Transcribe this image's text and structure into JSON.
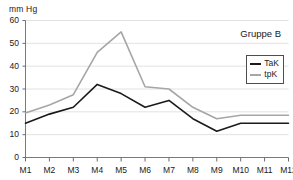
{
  "chart_data": {
    "type": "line",
    "title": "",
    "annotation": "Gruppe B",
    "xlabel": "",
    "ylabel": "mm Hg",
    "ylim": [
      0,
      60
    ],
    "yticks": [
      0,
      10,
      20,
      30,
      40,
      50,
      60
    ],
    "ytick_labels": [
      "0",
      "10",
      "20",
      "30",
      "40",
      "50",
      "60"
    ],
    "grid": true,
    "legend_position": "top-right",
    "categories": [
      "M1",
      "M2",
      "M3",
      "M4",
      "M5",
      "M6",
      "M7",
      "M8",
      "M9",
      "M10",
      "M11",
      "M12"
    ],
    "series": [
      {
        "name": "TaK",
        "color": "#1a1a1a",
        "values": [
          15,
          19,
          22,
          32,
          28,
          22,
          25,
          17,
          11.5,
          15,
          15,
          15
        ]
      },
      {
        "name": "tpK",
        "color": "#a6a6a6",
        "values": [
          19.5,
          23,
          27.5,
          46,
          55,
          31,
          30,
          22,
          17,
          18.5,
          18.5,
          18.5
        ]
      }
    ]
  },
  "legend": {
    "items": [
      {
        "label": "TaK",
        "color": "#1a1a1a"
      },
      {
        "label": "tpK",
        "color": "#a6a6a6"
      }
    ]
  },
  "axis": {
    "unit_label": "mm Hg"
  }
}
